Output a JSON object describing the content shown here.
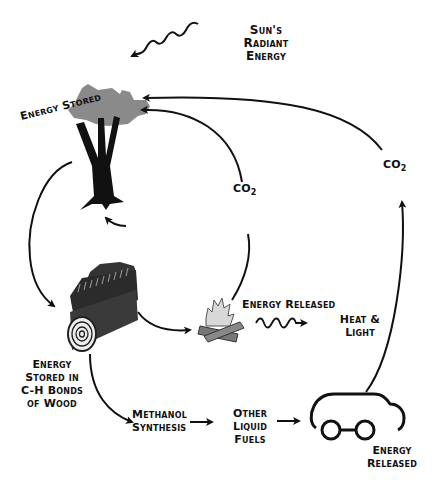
{
  "diagram": {
    "colors": {
      "line": "#111111",
      "foliage": "#8a8a8a",
      "trunk": "#111111",
      "log": "#3a3a3a",
      "background": "#ffffff"
    },
    "nodes": {
      "sun": {
        "lines": [
          "Sun's",
          "Radiant",
          "Energy"
        ]
      },
      "tree": {
        "label": "Energy Stored"
      },
      "wood": {
        "lines": [
          "Energy",
          "Stored in",
          "C-H Bonds",
          "of Wood"
        ]
      },
      "fire": {
        "label": "Energy Released"
      },
      "heat": {
        "lines": [
          "Heat &",
          "Light"
        ]
      },
      "methanol": {
        "lines": [
          "Methanol",
          "Synthesis"
        ]
      },
      "fuels": {
        "lines": [
          "Other",
          "Liquid",
          "Fuels"
        ]
      },
      "car": {
        "lines": [
          "Energy",
          "Released"
        ]
      },
      "co2_inner": {
        "main": "CO",
        "sub": "2"
      },
      "co2_outer": {
        "main": "CO",
        "sub": "2"
      }
    },
    "edges": [
      {
        "from": "sun",
        "to": "tree",
        "style": "wavy"
      },
      {
        "from": "tree",
        "to": "wood"
      },
      {
        "from": "wood",
        "to": "fire"
      },
      {
        "from": "fire",
        "to": "heat",
        "style": "wavy"
      },
      {
        "from": "fire",
        "to": "tree",
        "label": "CO2"
      },
      {
        "from": "wood",
        "to": "methanol"
      },
      {
        "from": "methanol",
        "to": "fuels"
      },
      {
        "from": "fuels",
        "to": "car"
      },
      {
        "from": "car",
        "to": "tree",
        "label": "CO2"
      },
      {
        "from": "ground",
        "to": "tree"
      }
    ]
  }
}
